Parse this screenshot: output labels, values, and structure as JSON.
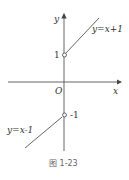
{
  "figure": {
    "caption": "图 1-23",
    "axes": {
      "x_label": "x",
      "y_label": "y",
      "origin_label": "O"
    },
    "tick_labels": {
      "y_pos": "1",
      "y_neg": "-1"
    },
    "curves": [
      {
        "label": "y=x+1",
        "domain": "x>0",
        "start_point": [
          0,
          1
        ],
        "open_circle": true
      },
      {
        "label": "y=x-1",
        "domain": "x<0",
        "start_point": [
          0,
          -1
        ],
        "open_circle": true
      }
    ]
  }
}
